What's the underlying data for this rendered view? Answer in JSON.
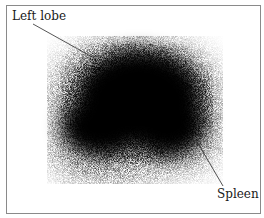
{
  "figure": {
    "type": "scintigraphy-scan",
    "labels": {
      "left_lobe": "Left lobe",
      "spleen": "Spleen"
    },
    "colors": {
      "uptake": "#000000",
      "background": "#ffffff",
      "border": "#8a8a8a",
      "leader_line": "#2a2a2a"
    }
  }
}
